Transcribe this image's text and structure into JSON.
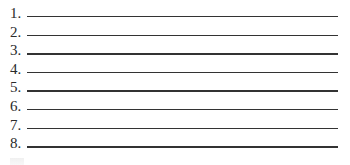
{
  "worksheet": {
    "items": [
      {
        "number": "1.",
        "value": ""
      },
      {
        "number": "2.",
        "value": ""
      },
      {
        "number": "3.",
        "value": ""
      },
      {
        "number": "4.",
        "value": ""
      },
      {
        "number": "5.",
        "value": ""
      },
      {
        "number": "6.",
        "value": ""
      },
      {
        "number": "7.",
        "value": ""
      },
      {
        "number": "8.",
        "value": ""
      }
    ],
    "line_color": "#333333"
  }
}
